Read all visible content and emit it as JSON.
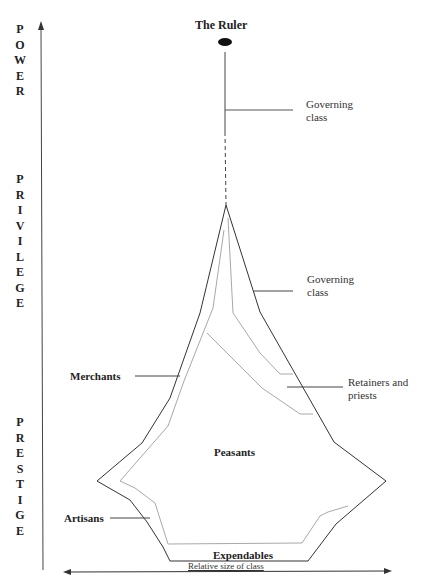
{
  "diagram": {
    "title_ruler": "The Ruler",
    "vertical_axis": {
      "segments": [
        {
          "word": "POWER",
          "letters": [
            "P",
            "O",
            "W",
            "E",
            "R"
          ]
        },
        {
          "word": "PRIVILEGE",
          "letters": [
            "P",
            "R",
            "I",
            "V",
            "I",
            "L",
            "E",
            "G",
            "E"
          ]
        },
        {
          "word": "PRESTIGE",
          "letters": [
            "P",
            "R",
            "E",
            "S",
            "T",
            "I",
            "G",
            "E"
          ]
        }
      ]
    },
    "horizontal_axis_label": "Relative size of class",
    "labels": {
      "governing_class_top_line1": "Governing",
      "governing_class_top_line2": "class",
      "governing_class_mid_line1": "Governing",
      "governing_class_mid_line2": "class",
      "merchants": "Merchants",
      "retainers_line1": "Retainers and",
      "retainers_line2": "priests",
      "peasants": "Peasants",
      "artisans": "Artisans",
      "expendables": "Expendables"
    },
    "colors": {
      "outline": "#333333",
      "inner_lines": "#a8a8a8",
      "text": "#222222"
    }
  }
}
